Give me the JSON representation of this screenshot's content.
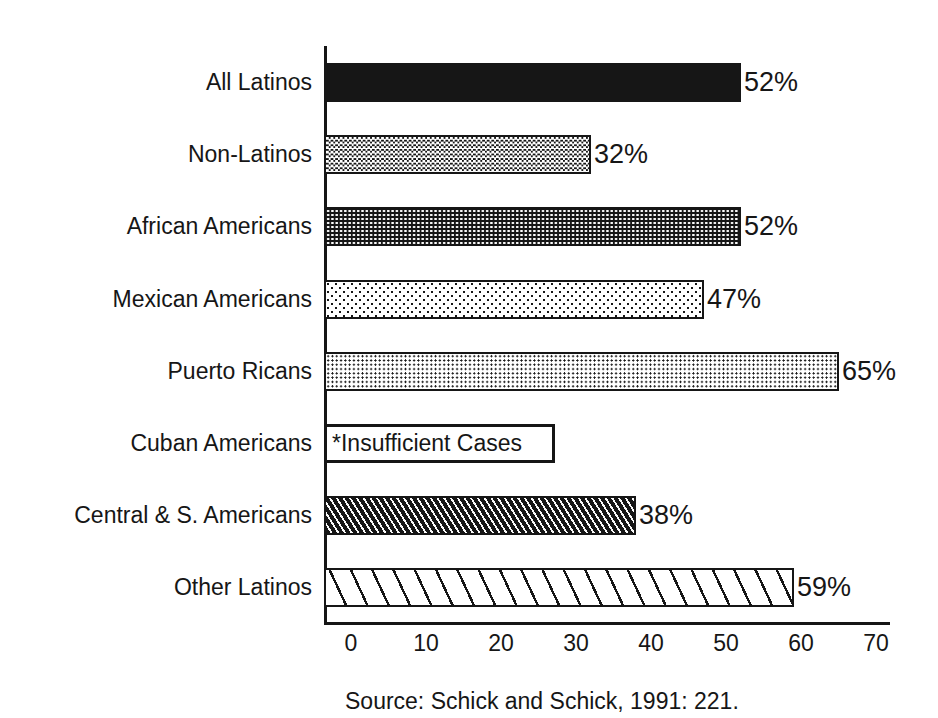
{
  "page": {
    "background_color": "#ffffff",
    "ink_color": "#161616"
  },
  "chart_data": {
    "type": "bar",
    "orientation": "horizontal",
    "title": "",
    "xlabel": "",
    "ylabel": "",
    "unit": "%",
    "x_axis": {
      "min": 0,
      "max": 70,
      "ticks": [
        0,
        10,
        20,
        30,
        40,
        50,
        60,
        70
      ],
      "grid": false
    },
    "categories": [
      "All Latinos",
      "Non-Latinos",
      "African Americans",
      "Mexican Americans",
      "Puerto Ricans",
      "Cuban Americans",
      "Central & S. Americans",
      "Other Latinos"
    ],
    "bars": [
      {
        "label": "All Latinos",
        "value": 52,
        "value_label": "52%",
        "pattern": "solid-black"
      },
      {
        "label": "Non-Latinos",
        "value": 32,
        "value_label": "32%",
        "pattern": "fine-checker"
      },
      {
        "label": "African Americans",
        "value": 52,
        "value_label": "52%",
        "pattern": "white-dots-on-black"
      },
      {
        "label": "Mexican Americans",
        "value": 47,
        "value_label": "47%",
        "pattern": "sparse-dots"
      },
      {
        "label": "Puerto Ricans",
        "value": 65,
        "value_label": "65%",
        "pattern": "dense-dots"
      },
      {
        "label": "Cuban Americans",
        "value": null,
        "value_label": "",
        "pattern": "outline-box",
        "annotation": "*Insufficient Cases"
      },
      {
        "label": "Central & S. Americans",
        "value": 38,
        "value_label": "38%",
        "pattern": "dense-diagonal-hatch"
      },
      {
        "label": "Other Latinos",
        "value": 59,
        "value_label": "59%",
        "pattern": "light-diagonal-hatch"
      }
    ],
    "legend": null,
    "source_note": "Source: Schick and Schick, 1991: 221."
  }
}
